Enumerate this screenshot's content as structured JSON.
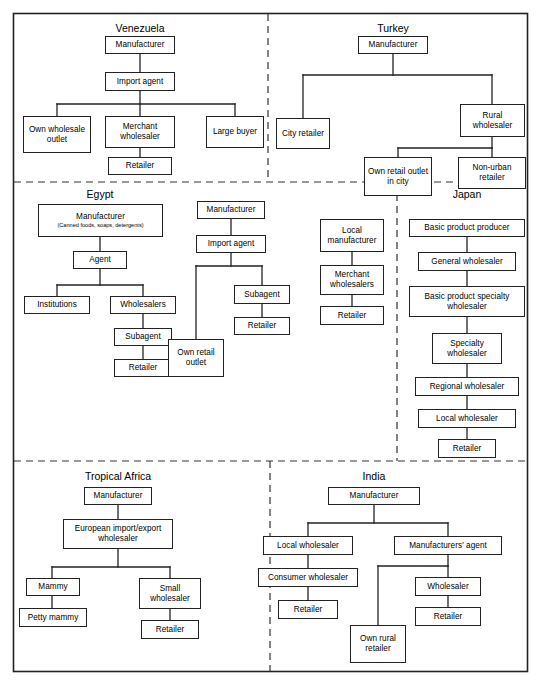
{
  "figure": {
    "type": "diagram",
    "border_color": "#222222",
    "divider_style": "dashed"
  },
  "panels": [
    {
      "id": "venezuela",
      "title": "Venezuela",
      "nodes": [
        {
          "key": "manufacturer",
          "label": "Manufacturer"
        },
        {
          "key": "import_agent",
          "label": "Import agent"
        },
        {
          "key": "own_wholesale_outlet",
          "label": "Own wholesale outlet"
        },
        {
          "key": "merchant_wholesaler",
          "label": "Merchant wholesaler"
        },
        {
          "key": "large_buyer",
          "label": "Large buyer"
        },
        {
          "key": "retailer",
          "label": "Retailer"
        }
      ]
    },
    {
      "id": "turkey",
      "title": "Turkey",
      "nodes": [
        {
          "key": "manufacturer",
          "label": "Manufacturer"
        },
        {
          "key": "city_retailer",
          "label": "City retailer"
        },
        {
          "key": "rural_wholesaler",
          "label": "Rural wholesaler"
        },
        {
          "key": "own_retail_outlet_in_city",
          "label": "Own retail outlet in city"
        },
        {
          "key": "non_urban_retailer",
          "label": "Non-urban retailer"
        }
      ]
    },
    {
      "id": "egypt",
      "title": "Egypt",
      "nodes": [
        {
          "key": "manufacturer",
          "label": "Manufacturer",
          "sub": "(Canned foods, soaps, detergents)"
        },
        {
          "key": "agent",
          "label": "Agent"
        },
        {
          "key": "institutions",
          "label": "Institutions"
        },
        {
          "key": "wholesalers",
          "label": "Wholesalers"
        },
        {
          "key": "subagent",
          "label": "Subagent"
        },
        {
          "key": "retailer",
          "label": "Retailer"
        },
        {
          "key": "manufacturer2",
          "label": "Manufacturer"
        },
        {
          "key": "import_agent",
          "label": "Import agent"
        },
        {
          "key": "subagent2",
          "label": "Subagent"
        },
        {
          "key": "retailer2",
          "label": "Retailer"
        },
        {
          "key": "own_retail_outlet",
          "label": "Own retail outlet"
        },
        {
          "key": "local_manufacturer",
          "label": "Local manufacturer"
        },
        {
          "key": "merchant_wholesalers",
          "label": "Merchant wholesalers"
        },
        {
          "key": "retailer3",
          "label": "Retailer"
        }
      ]
    },
    {
      "id": "japan",
      "title": "Japan",
      "nodes": [
        {
          "key": "basic_product_producer",
          "label": "Basic product producer"
        },
        {
          "key": "general_wholesaler",
          "label": "General wholesaler"
        },
        {
          "key": "basic_product_specialty_wholesaler",
          "label": "Basic product specialty wholesaler"
        },
        {
          "key": "specialty_wholesaler",
          "label": "Specialty wholesaler"
        },
        {
          "key": "regional_wholesaler",
          "label": "Regional wholesaler"
        },
        {
          "key": "local_wholesaler",
          "label": "Local wholesaler"
        },
        {
          "key": "retailer",
          "label": "Retailer"
        }
      ]
    },
    {
      "id": "tropical-africa",
      "title": "Tropical Africa",
      "nodes": [
        {
          "key": "manufacturer",
          "label": "Manufacturer"
        },
        {
          "key": "european_import_export_wholesaler",
          "label": "European import/export wholesaler"
        },
        {
          "key": "mammy",
          "label": "Mammy"
        },
        {
          "key": "petty_mammy",
          "label": "Petty mammy"
        },
        {
          "key": "small_wholesaler",
          "label": "Small wholesaler"
        },
        {
          "key": "retailer",
          "label": "Retailer"
        }
      ]
    },
    {
      "id": "india",
      "title": "India",
      "nodes": [
        {
          "key": "manufacturer",
          "label": "Manufacturer"
        },
        {
          "key": "local_wholesaler",
          "label": "Local wholesaler"
        },
        {
          "key": "manufacturers_agent",
          "label": "Manufacturers' agent"
        },
        {
          "key": "consumer_wholesaler",
          "label": "Consumer wholesaler"
        },
        {
          "key": "wholesaler",
          "label": "Wholesaler"
        },
        {
          "key": "retailer_left",
          "label": "Retailer"
        },
        {
          "key": "retailer_right",
          "label": "Retailer"
        },
        {
          "key": "own_rural_retailer",
          "label": "Own rural retailer"
        }
      ]
    }
  ]
}
